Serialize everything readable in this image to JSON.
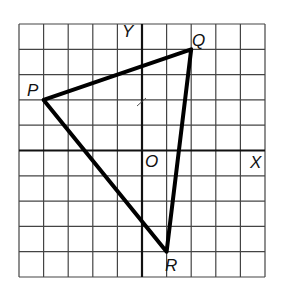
{
  "diagram": {
    "grid": {
      "cols": 10,
      "rows": 10,
      "x_range": [
        -5,
        5
      ],
      "y_range": [
        -5,
        5
      ]
    },
    "axes": {
      "x_label": "X",
      "y_label": "Y",
      "origin_label": "O"
    },
    "points": [
      {
        "label": "P",
        "x": -4,
        "y": 2
      },
      {
        "label": "Q",
        "x": 2,
        "y": 4
      },
      {
        "label": "R",
        "x": 1,
        "y": -4
      }
    ],
    "shape": "triangle PQR",
    "colors": {
      "grid": "#333333",
      "axes": "#111111",
      "triangle": "#000000",
      "background": "#ffffff"
    }
  }
}
